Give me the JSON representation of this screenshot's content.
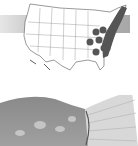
{
  "image": {
    "description": "Species range map of the contiguous United States with eastern states shaded, above a grayscale close-up photo of a fish body and tail fin",
    "map": {
      "subject": "contiguous-us-outline",
      "shaded_region": "eastern-us-range",
      "shade_color": "#555555",
      "outline_color": "#444444",
      "band_color": "#b0b0b0"
    },
    "photo": {
      "subject": "fish-body-and-tail",
      "tone": "grayscale"
    }
  }
}
